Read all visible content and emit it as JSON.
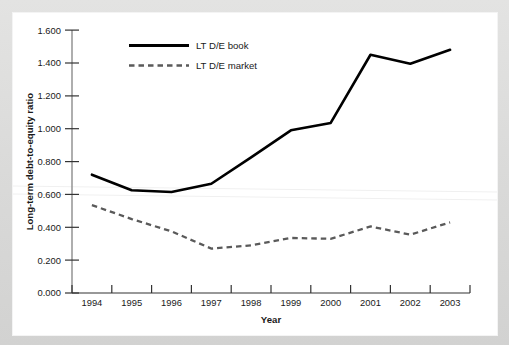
{
  "figure": {
    "background_color": "#dcdcdb",
    "card_color": "#ffffff"
  },
  "chart_data": {
    "type": "line",
    "title": "",
    "xlabel": "Year",
    "ylabel": "Long-term debt-to-equity ratio",
    "categories": [
      "1994",
      "1995",
      "1996",
      "1997",
      "1998",
      "1999",
      "2000",
      "2001",
      "2002",
      "2003"
    ],
    "x": [
      1994,
      1995,
      1996,
      1997,
      1998,
      1999,
      2000,
      2001,
      2002,
      2003
    ],
    "series": [
      {
        "name": "LT D/E book",
        "style": "solid",
        "color": "#000000",
        "values": [
          0.72,
          0.625,
          0.615,
          0.665,
          0.825,
          0.99,
          1.035,
          1.45,
          1.395,
          1.48
        ]
      },
      {
        "name": "LT D/E market",
        "style": "dashed",
        "color": "#5a5a5a",
        "values": [
          0.535,
          0.45,
          0.375,
          0.27,
          0.29,
          0.335,
          0.33,
          0.405,
          0.355,
          0.43
        ]
      }
    ],
    "ylim": [
      0.0,
      1.6
    ],
    "ytick_step": 0.2,
    "ytick_labels": [
      "0.000",
      "0.200",
      "0.400",
      "0.600",
      "0.800",
      "1.000",
      "1.200",
      "1.400",
      "1.600"
    ],
    "ytick_values": [
      0.0,
      0.2,
      0.4,
      0.6,
      0.8,
      1.0,
      1.2,
      1.4,
      1.6
    ],
    "xtick_labels": [
      "1994",
      "1995",
      "1996",
      "1997",
      "1998",
      "1999",
      "2000",
      "2001",
      "2002",
      "2003"
    ],
    "grid": false,
    "legend_position": "top-center"
  },
  "axes": {
    "y_title": "Long-term debt-to-equity ratio",
    "x_title": "Year"
  },
  "legend": {
    "entries": [
      {
        "label": "LT D/E book",
        "style": "solid"
      },
      {
        "label": "LT D/E market",
        "style": "dashed"
      }
    ]
  }
}
